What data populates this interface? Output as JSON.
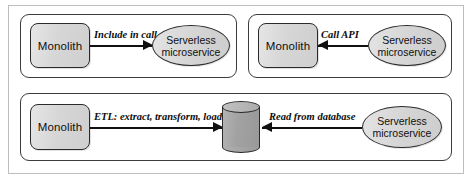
{
  "figure": {
    "panels": [
      {
        "id": "panel-a",
        "source": {
          "type": "monolith",
          "label": "Monolith"
        },
        "target": {
          "type": "serverless",
          "label_line1": "Serverless",
          "label_line2": "microservice"
        },
        "edge": {
          "label": "Include in call",
          "direction": "right"
        }
      },
      {
        "id": "panel-b",
        "source": {
          "type": "serverless",
          "label_line1": "Serverless",
          "label_line2": "microservice"
        },
        "target": {
          "type": "monolith",
          "label": "Monolith"
        },
        "edge": {
          "label": "Call API",
          "direction": "left"
        }
      },
      {
        "id": "panel-c",
        "source": {
          "type": "monolith",
          "label": "Monolith"
        },
        "middle": {
          "type": "database",
          "label": ""
        },
        "target": {
          "type": "serverless",
          "label_line1": "Serverless",
          "label_line2": "microservice"
        },
        "edge_left": {
          "label": "ETL: extract, transform, load",
          "direction": "right"
        },
        "edge_right": {
          "label": "Read from database",
          "direction": "left"
        }
      }
    ],
    "colors": {
      "node_fill": "#d6d6d6",
      "node_stroke": "#2a2a2a",
      "database_fill": "#a2a2a2",
      "panel_stroke": "#3c3c3c",
      "frame_stroke": "#bdbdbd",
      "arrow": "#111111",
      "background": "#ffffff"
    }
  }
}
